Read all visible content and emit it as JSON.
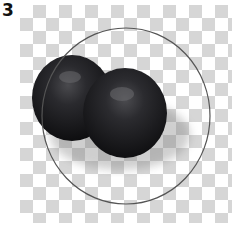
{
  "step": {
    "number": "3"
  },
  "canvas": {
    "background": "transparency-checkerboard",
    "checker_color": "#d6d6d6"
  },
  "objects": [
    {
      "type": "sphere",
      "label": "left-sphere",
      "color": "#1c1c1f"
    },
    {
      "type": "sphere",
      "label": "right-sphere",
      "color": "#1c1c1f"
    },
    {
      "type": "ellipse-outline",
      "label": "selection-ellipse",
      "stroke": "#555555"
    }
  ]
}
